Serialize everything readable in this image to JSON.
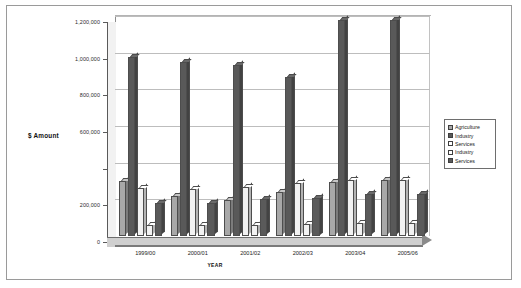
{
  "chart_data": {
    "type": "bar",
    "title": "",
    "xlabel": "YEAR",
    "ylabel": "$ Amount",
    "ylim": [
      0,
      1200000
    ],
    "ytick_labels": [
      "0",
      "200,000",
      "",
      "600,000",
      "800,000",
      "1,000,000",
      "1,200,000"
    ],
    "ytick_values": [
      0,
      200000,
      400000,
      600000,
      800000,
      1000000,
      1200000
    ],
    "grid": true,
    "legend_position": "right",
    "categories": [
      "1999/00",
      "2000/01",
      "2001/02",
      "2002/03",
      "2003/04",
      "2005/06"
    ],
    "series": [
      {
        "name": "Agriculture",
        "color": "#a8a8a8",
        "values": [
          300000,
          220000,
          195000,
          240000,
          295000,
          305000
        ]
      },
      {
        "name": "Industry",
        "color": "#595959",
        "values": [
          975000,
          950000,
          935000,
          865000,
          1180000,
          1180000
        ]
      },
      {
        "name": "Services",
        "color": "#f2f2f2",
        "values": [
          260000,
          255000,
          265000,
          290000,
          305000,
          305000
        ]
      },
      {
        "name": "Industry",
        "color": "#f2f2f2",
        "values": [
          62000,
          60000,
          62000,
          68000,
          70000,
          70000
        ]
      },
      {
        "name": "Services",
        "color": "#5a5a5a",
        "values": [
          180000,
          178000,
          200000,
          210000,
          228000,
          228000
        ]
      }
    ]
  },
  "legend": {
    "items": [
      {
        "label": "Agriculture",
        "color": "#a8a8a8"
      },
      {
        "label": "Industry",
        "color": "#595959"
      },
      {
        "label": "Services",
        "color": "#ffffff"
      },
      {
        "label": "Industry",
        "color": "#ffffff"
      },
      {
        "label": "Services",
        "color": "#5a5a5a"
      }
    ]
  },
  "axes": {
    "y_title": "$ Amount",
    "x_title": "YEAR"
  }
}
